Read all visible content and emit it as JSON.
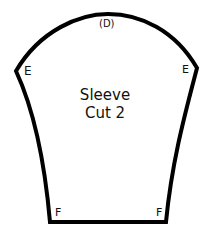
{
  "diagram": {
    "type": "sewing-pattern-piece",
    "piece_name": "Sleeve",
    "cut_instruction": "Cut 2",
    "labels": {
      "top": "(D)",
      "left_shoulder": "E",
      "right_shoulder": "E",
      "bottom_left": "F",
      "bottom_right": "F"
    },
    "outline_color": "#000000",
    "background_color": "#ffffff"
  }
}
